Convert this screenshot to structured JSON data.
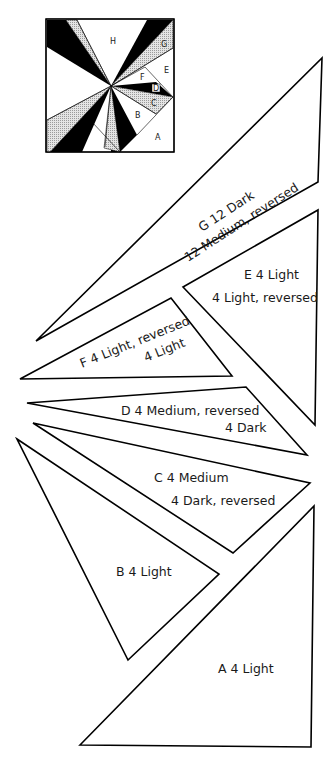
{
  "diagram": {
    "block": {
      "labels": [
        "H",
        "G",
        "E",
        "F",
        "D",
        "C",
        "B",
        "A"
      ]
    },
    "pieces": [
      {
        "id": "G",
        "line1": "G  12 Dark",
        "line2": "12 Medium, reversed"
      },
      {
        "id": "E",
        "line1": "E  4 Light",
        "line2": "4 Light, reversed"
      },
      {
        "id": "F",
        "line1": "F  4 Light, reversed",
        "line2": "4 Light"
      },
      {
        "id": "D",
        "line1": "D  4 Medium, reversed",
        "line2": "4 Dark"
      },
      {
        "id": "C",
        "line1": "C  4 Medium",
        "line2": "4 Dark, reversed"
      },
      {
        "id": "B",
        "line1": "B  4 Light"
      },
      {
        "id": "A",
        "line1": "A  4 Light"
      }
    ],
    "colors": {
      "dark": "#000000",
      "medium": "#c8c8c8",
      "light": "#ffffff",
      "outline": "#000000"
    }
  }
}
